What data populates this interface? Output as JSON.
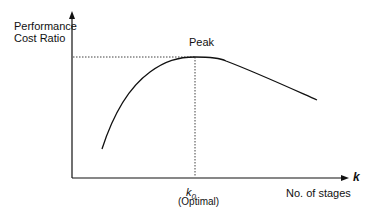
{
  "diagram": {
    "y_axis_label_line1": "Performance",
    "y_axis_label_line2": "Cost Ratio",
    "x_axis_label": "No. of stages",
    "x_axis_symbol": "k",
    "peak_label": "Peak",
    "optimal_symbol": "k",
    "optimal_subscript": "0",
    "optimal_label": "(Optimal)"
  },
  "colors": {
    "line": "#111111",
    "background": "#ffffff"
  }
}
